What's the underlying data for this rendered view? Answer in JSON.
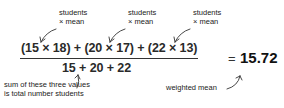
{
  "annotations": {
    "product_1": {
      "line1": "students",
      "line2": "× mean"
    },
    "product_2": {
      "line1": "students",
      "line2": "× mean"
    },
    "product_3": {
      "line1": "students",
      "line2": "× mean"
    },
    "denominator_note": {
      "line1": "sum of these three values",
      "line2": "is total number students"
    },
    "result_note": "weighted mean"
  },
  "formula": {
    "numerator": "(15 × 18) + (20 × 17) + (22 × 13)",
    "denominator": "15 + 20 + 22",
    "equals": "=",
    "result": "15.72"
  },
  "terms": [
    {
      "students": 15,
      "mean": 18
    },
    {
      "students": 20,
      "mean": 17
    },
    {
      "students": 22,
      "mean": 13
    }
  ]
}
